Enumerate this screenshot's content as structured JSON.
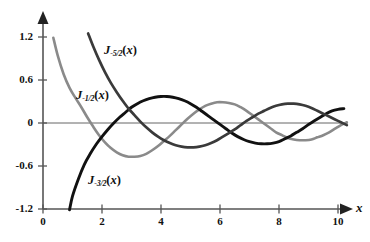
{
  "chart_data": {
    "type": "line",
    "title": "",
    "xlabel": "x",
    "ylabel": "",
    "xlim": [
      0,
      10.6
    ],
    "ylim": [
      -1.2,
      1.35
    ],
    "grid": false,
    "legend": "inline-curve-labels",
    "xticks": [
      "0",
      "2",
      "4",
      "6",
      "8",
      "10"
    ],
    "xtick_values": [
      0,
      2,
      4,
      6,
      8,
      10
    ],
    "yticks": [
      "1.2",
      "0.6",
      "0",
      "-0.6",
      "-1.2"
    ],
    "ytick_values": [
      1.2,
      0.6,
      0,
      -0.6,
      -1.2
    ],
    "series": [
      {
        "name": "J_-1/2(x)",
        "label_base": "J",
        "label_sub": "-1/2",
        "label_arg": "(x)",
        "color": "#8a8a8a",
        "x": [
          0.35,
          0.5,
          0.7,
          0.9,
          1.1,
          1.3,
          1.5,
          1.7,
          1.9,
          2.1,
          2.3,
          2.5,
          2.7,
          2.9,
          3.1,
          3.3,
          3.5,
          3.7,
          3.9,
          4.1,
          4.3,
          4.5,
          4.7,
          4.9,
          5.1,
          5.3,
          5.5,
          5.7,
          5.9,
          6.1,
          6.3,
          6.5,
          6.7,
          6.9,
          7.1,
          7.3,
          7.5,
          7.7,
          7.9,
          8.1,
          8.3,
          8.5,
          8.7,
          8.9,
          9.1,
          9.3,
          9.5,
          9.7,
          9.9,
          10.1,
          10.3
        ],
        "y": [
          1.19,
          0.94,
          0.68,
          0.49,
          0.35,
          0.22,
          0.08,
          -0.05,
          -0.17,
          -0.27,
          -0.35,
          -0.41,
          -0.45,
          -0.47,
          -0.47,
          -0.46,
          -0.43,
          -0.38,
          -0.32,
          -0.25,
          -0.18,
          -0.1,
          -0.02,
          0.06,
          0.13,
          0.19,
          0.24,
          0.27,
          0.29,
          0.29,
          0.28,
          0.26,
          0.22,
          0.17,
          0.11,
          0.05,
          -0.01,
          -0.07,
          -0.13,
          -0.17,
          -0.21,
          -0.23,
          -0.24,
          -0.24,
          -0.23,
          -0.2,
          -0.17,
          -0.13,
          -0.08,
          -0.03,
          0.01
        ]
      },
      {
        "name": "J_-3/2(x)",
        "label_base": "J",
        "label_sub": "-3/2",
        "label_arg": "(x)",
        "color": "#111111",
        "x": [
          0.9,
          1.0,
          1.2,
          1.4,
          1.6,
          1.8,
          2.0,
          2.2,
          2.4,
          2.6,
          2.8,
          3.0,
          3.2,
          3.4,
          3.6,
          3.8,
          4.0,
          4.2,
          4.4,
          4.6,
          4.8,
          5.0,
          5.2,
          5.4,
          5.6,
          5.8,
          6.0,
          6.2,
          6.4,
          6.6,
          6.8,
          7.0,
          7.2,
          7.4,
          7.6,
          7.8,
          8.0,
          8.2,
          8.4,
          8.6,
          8.8,
          9.0,
          9.2,
          9.4,
          9.6,
          9.8,
          10.0,
          10.2
        ],
        "y": [
          -1.21,
          -1.02,
          -0.78,
          -0.58,
          -0.43,
          -0.3,
          -0.19,
          -0.09,
          0.0,
          0.08,
          0.15,
          0.22,
          0.27,
          0.31,
          0.34,
          0.36,
          0.37,
          0.37,
          0.36,
          0.34,
          0.31,
          0.27,
          0.22,
          0.16,
          0.1,
          0.04,
          -0.02,
          -0.08,
          -0.14,
          -0.19,
          -0.23,
          -0.26,
          -0.28,
          -0.29,
          -0.29,
          -0.28,
          -0.26,
          -0.22,
          -0.18,
          -0.13,
          -0.08,
          -0.02,
          0.03,
          0.08,
          0.13,
          0.17,
          0.19,
          0.2
        ]
      },
      {
        "name": "J_-5/2(x)",
        "label_base": "J",
        "label_sub": "-5/2",
        "label_arg": "(x)",
        "color": "#3a3a3a",
        "x": [
          1.53,
          1.7,
          1.9,
          2.1,
          2.3,
          2.5,
          2.7,
          2.9,
          3.1,
          3.3,
          3.5,
          3.7,
          3.9,
          4.1,
          4.3,
          4.5,
          4.7,
          4.9,
          5.1,
          5.3,
          5.5,
          5.7,
          5.9,
          6.1,
          6.3,
          6.5,
          6.7,
          6.9,
          7.1,
          7.3,
          7.5,
          7.7,
          7.9,
          8.1,
          8.3,
          8.5,
          8.7,
          8.9,
          9.1,
          9.3,
          9.5,
          9.7,
          9.9,
          10.1,
          10.3
        ],
        "y": [
          1.25,
          1.07,
          0.88,
          0.71,
          0.56,
          0.43,
          0.31,
          0.2,
          0.11,
          0.02,
          -0.06,
          -0.13,
          -0.19,
          -0.24,
          -0.28,
          -0.31,
          -0.33,
          -0.34,
          -0.34,
          -0.33,
          -0.31,
          -0.28,
          -0.24,
          -0.19,
          -0.14,
          -0.09,
          -0.03,
          0.03,
          0.08,
          0.13,
          0.17,
          0.21,
          0.24,
          0.26,
          0.27,
          0.27,
          0.26,
          0.24,
          0.21,
          0.17,
          0.13,
          0.09,
          0.05,
          0.01,
          -0.03
        ]
      }
    ]
  },
  "axes": {
    "x_axis_name": "x",
    "y_tick_1": "1.2",
    "y_tick_2": "0.6",
    "y_tick_3": "0",
    "y_tick_4": "-0.6",
    "y_tick_5": "-1.2",
    "x_tick_1": "0",
    "x_tick_2": "2",
    "x_tick_3": "4",
    "x_tick_4": "6",
    "x_tick_5": "8",
    "x_tick_6": "10"
  },
  "colors": {
    "curve_light_gray": "#8a8a8a",
    "curve_dark_gray": "#3a3a3a",
    "curve_black": "#111111",
    "axis": "#555555",
    "text": "#111111",
    "background": "#ffffff"
  }
}
